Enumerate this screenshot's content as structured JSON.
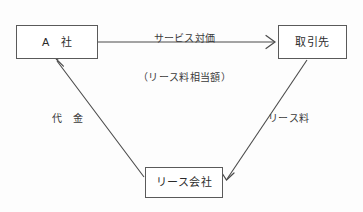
{
  "diagram": {
    "background_color": "#fdfdfd",
    "line_color": "#5a5a5a",
    "text_color": "#2b2b2b",
    "nodes": [
      {
        "id": "company-a",
        "label": "A　社",
        "x": 16,
        "y": 25,
        "w": 82,
        "h": 34
      },
      {
        "id": "customer",
        "label": "取引先",
        "x": 278,
        "y": 25,
        "w": 69,
        "h": 34
      },
      {
        "id": "lease-company",
        "label": "リース会社",
        "x": 145,
        "y": 167,
        "w": 78,
        "h": 31
      }
    ],
    "edges": [
      {
        "id": "service-consideration",
        "from": "company-a",
        "to": "customer",
        "label_line1": "サービス対価",
        "label_line2": "（リース料相当額）",
        "arrowhead": "open-v",
        "direction": "right"
      },
      {
        "id": "payment",
        "from": "lease-company",
        "to": "company-a",
        "label": "代　金",
        "arrowhead": "open-v",
        "direction": "up-left"
      },
      {
        "id": "lease-fee",
        "from": "customer",
        "to": "lease-company",
        "label": "リース料",
        "arrowhead": "open-v",
        "direction": "down-left"
      }
    ]
  }
}
